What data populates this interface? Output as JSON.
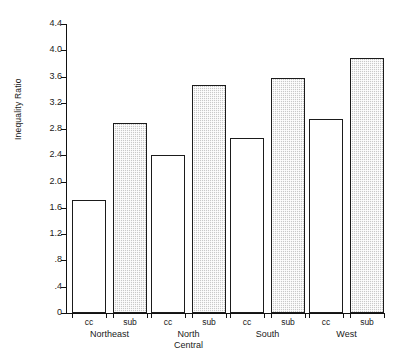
{
  "chart_data": {
    "type": "bar",
    "title": "",
    "xlabel": "",
    "ylabel": "Inequality Ratio",
    "ylim": [
      0,
      4.4
    ],
    "grid": false,
    "legend": "none",
    "ytick_labels": [
      "4.4",
      "4.0",
      "3.6",
      "3.2",
      "2.8",
      "2.4",
      "2.0",
      "1.6",
      "1.2",
      ".8",
      ".4",
      "0"
    ],
    "ytick_values": [
      4.4,
      4.0,
      3.6,
      3.2,
      2.8,
      2.4,
      2.0,
      1.6,
      1.2,
      0.8,
      0.4,
      0
    ],
    "categories": [
      "Northeast",
      "North Central",
      "South",
      "West"
    ],
    "category_lines": [
      [
        "Northeast"
      ],
      [
        "North",
        "Central"
      ],
      [
        "South"
      ],
      [
        "West"
      ]
    ],
    "series": [
      {
        "name": "cc",
        "style": "open",
        "values": [
          1.72,
          2.4,
          2.67,
          2.96
        ]
      },
      {
        "name": "sub",
        "style": "shaded",
        "values": [
          2.9,
          3.47,
          3.58,
          3.88
        ]
      }
    ],
    "bar_labels": [
      "cc",
      "sub",
      "cc",
      "sub",
      "cc",
      "sub",
      "cc",
      "sub"
    ],
    "colors": {
      "open_fill": "#ffffff",
      "shaded_fill": "#c9c9c9",
      "outline": "#1b1b1b",
      "axis": "#111111"
    }
  }
}
